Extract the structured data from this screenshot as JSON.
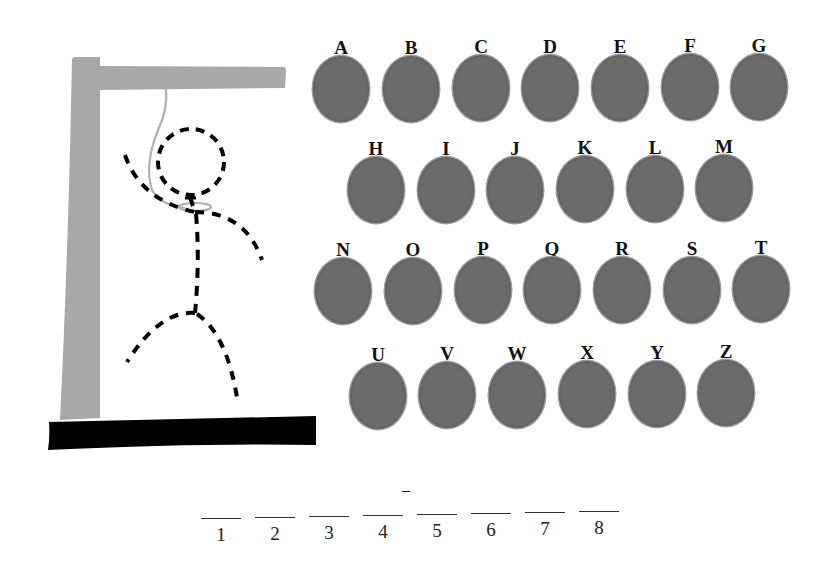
{
  "game": {
    "title": "Hangman",
    "colors": {
      "gallows": "#a8a8a8",
      "base": "#000000",
      "rope": "#b5b5b5",
      "figure": "#000000",
      "key": "#6b6b6b"
    }
  },
  "keyboard": {
    "rows": [
      [
        "A",
        "B",
        "C",
        "D",
        "E",
        "F",
        "G"
      ],
      [
        "H",
        "I",
        "J",
        "K",
        "L",
        "M"
      ],
      [
        "N",
        "O",
        "P",
        "Q",
        "R",
        "S",
        "T"
      ],
      [
        "U",
        "V",
        "W",
        "X",
        "Y",
        "Z"
      ]
    ],
    "keys": [
      {
        "letter": "A",
        "x": 311,
        "y": 38
      },
      {
        "letter": "B",
        "x": 381,
        "y": 38
      },
      {
        "letter": "C",
        "x": 451,
        "y": 37
      },
      {
        "letter": "D",
        "x": 520,
        "y": 37
      },
      {
        "letter": "E",
        "x": 590,
        "y": 37
      },
      {
        "letter": "F",
        "x": 660,
        "y": 36
      },
      {
        "letter": "G",
        "x": 729,
        "y": 36
      },
      {
        "letter": "H",
        "x": 346,
        "y": 139
      },
      {
        "letter": "I",
        "x": 416,
        "y": 139
      },
      {
        "letter": "J",
        "x": 485,
        "y": 139
      },
      {
        "letter": "K",
        "x": 555,
        "y": 138
      },
      {
        "letter": "L",
        "x": 625,
        "y": 138
      },
      {
        "letter": "M",
        "x": 694,
        "y": 137
      },
      {
        "letter": "N",
        "x": 313,
        "y": 240
      },
      {
        "letter": "O",
        "x": 383,
        "y": 240
      },
      {
        "letter": "P",
        "x": 453,
        "y": 239
      },
      {
        "letter": "Q",
        "x": 522,
        "y": 239
      },
      {
        "letter": "R",
        "x": 592,
        "y": 239
      },
      {
        "letter": "S",
        "x": 662,
        "y": 239
      },
      {
        "letter": "T",
        "x": 731,
        "y": 238
      },
      {
        "letter": "U",
        "x": 348,
        "y": 345
      },
      {
        "letter": "V",
        "x": 417,
        "y": 344
      },
      {
        "letter": "W",
        "x": 487,
        "y": 344
      },
      {
        "letter": "X",
        "x": 557,
        "y": 343
      },
      {
        "letter": "Y",
        "x": 627,
        "y": 343
      },
      {
        "letter": "Z",
        "x": 696,
        "y": 342
      }
    ]
  },
  "word": {
    "length": 8,
    "hint_mark": "–",
    "slots": [
      {
        "number": "1",
        "letter": "",
        "x": 201,
        "y": 518
      },
      {
        "number": "2",
        "letter": "",
        "x": 255,
        "y": 517
      },
      {
        "number": "3",
        "letter": "",
        "x": 309,
        "y": 516
      },
      {
        "number": "4",
        "letter": "",
        "x": 363,
        "y": 515
      },
      {
        "number": "5",
        "letter": "",
        "x": 417,
        "y": 514
      },
      {
        "number": "6",
        "letter": "",
        "x": 471,
        "y": 513
      },
      {
        "number": "7",
        "letter": "",
        "x": 525,
        "y": 512
      },
      {
        "number": "8",
        "letter": "",
        "x": 579,
        "y": 511
      }
    ]
  }
}
